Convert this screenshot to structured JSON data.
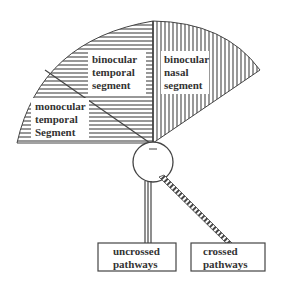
{
  "diagram": {
    "type": "visual field segments and pathways",
    "segments": {
      "monocular_temporal": {
        "line1": "monocular",
        "line2": "temporal",
        "line3": "Segment",
        "pattern": "horizontal-hatch"
      },
      "binocular_temporal": {
        "line1": "binocular",
        "line2": "temporal",
        "line3": "segment",
        "pattern": "horizontal-hatch"
      },
      "binocular_nasal": {
        "line1": "binocular",
        "line2": "nasal",
        "line3": "segment",
        "pattern": "vertical-hatch"
      }
    },
    "eye": {
      "label": ""
    },
    "pathways": {
      "uncrossed": {
        "line1": "uncrossed",
        "line2": "pathways",
        "style": "double-line"
      },
      "crossed": {
        "line1": "crossed",
        "line2": "pathways",
        "style": "striped-line"
      }
    },
    "colors": {
      "ink": "#333333",
      "background": "#ffffff"
    }
  }
}
